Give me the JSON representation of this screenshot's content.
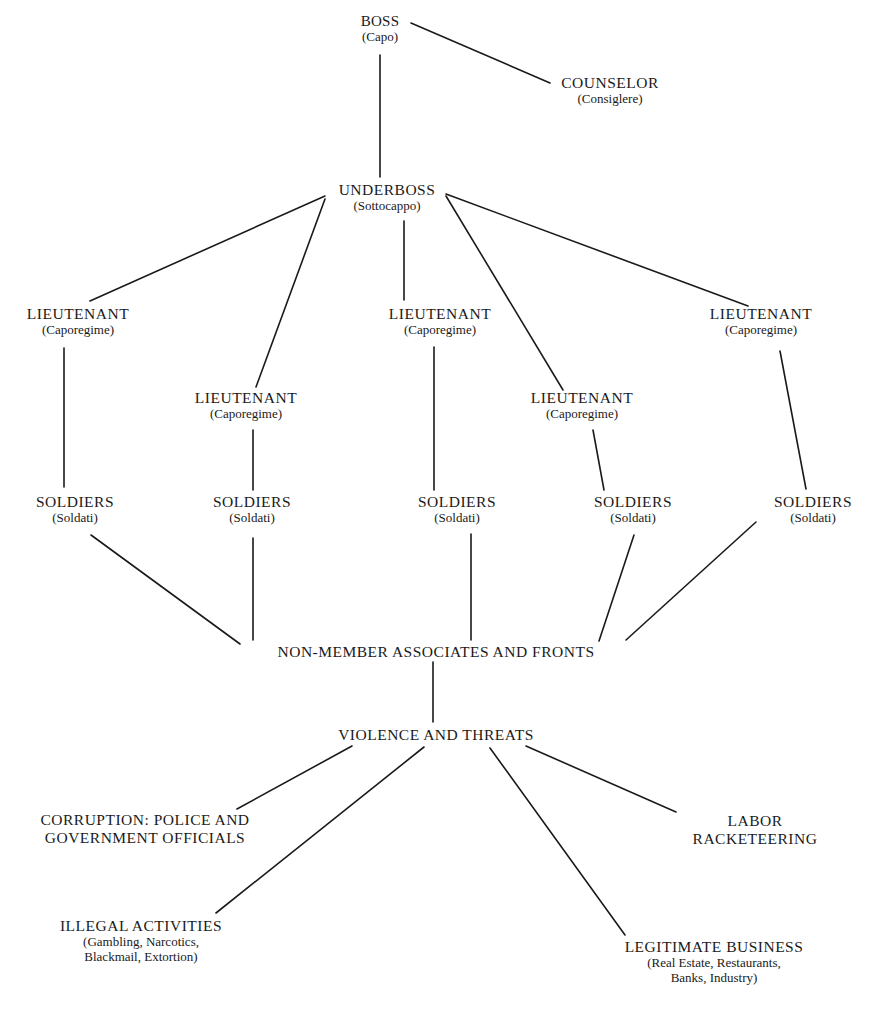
{
  "diagram": {
    "type": "organizational-hierarchy",
    "nodes": {
      "boss": {
        "title": "BOSS",
        "sub": "(Capo)"
      },
      "counselor": {
        "title": "COUNSELOR",
        "sub": "(Consiglere)"
      },
      "underboss": {
        "title": "UNDERBOSS",
        "sub": "(Sottocappo)"
      },
      "lieutenants": [
        {
          "title": "LIEUTENANT",
          "sub": "(Caporegime)"
        },
        {
          "title": "LIEUTENANT",
          "sub": "(Caporegime)"
        },
        {
          "title": "LIEUTENANT",
          "sub": "(Caporegime)"
        },
        {
          "title": "LIEUTENANT",
          "sub": "(Caporegime)"
        },
        {
          "title": "LIEUTENANT",
          "sub": "(Caporegime)"
        }
      ],
      "soldiers": [
        {
          "title": "SOLDIERS",
          "sub": "(Soldati)"
        },
        {
          "title": "SOLDIERS",
          "sub": "(Soldati)"
        },
        {
          "title": "SOLDIERS",
          "sub": "(Soldati)"
        },
        {
          "title": "SOLDIERS",
          "sub": "(Soldati)"
        },
        {
          "title": "SOLDIERS",
          "sub": "(Soldati)"
        }
      ],
      "associates": {
        "title": "NON-MEMBER ASSOCIATES AND FRONTS"
      },
      "violence": {
        "title": "VIOLENCE AND THREATS"
      },
      "corruption": {
        "line1": "CORRUPTION: POLICE AND",
        "line2": "GOVERNMENT OFFICIALS"
      },
      "labor": {
        "line1": "LABOR",
        "line2": "RACKETEERING"
      },
      "illegal": {
        "title": "ILLEGAL ACTIVITIES",
        "line1": "(Gambling, Narcotics,",
        "line2": "Blackmail, Extortion)"
      },
      "legitimate": {
        "title": "LEGITIMATE BUSINESS",
        "line1": "(Real Estate, Restaurants,",
        "line2": "Banks, Industry)"
      }
    },
    "edges": [
      [
        "boss",
        "counselor"
      ],
      [
        "boss",
        "underboss"
      ],
      [
        "underboss",
        "lieutenant-1"
      ],
      [
        "underboss",
        "lieutenant-2"
      ],
      [
        "underboss",
        "lieutenant-3"
      ],
      [
        "underboss",
        "lieutenant-4"
      ],
      [
        "underboss",
        "lieutenant-5"
      ],
      [
        "lieutenant-1",
        "soldiers-1"
      ],
      [
        "lieutenant-2",
        "soldiers-2"
      ],
      [
        "lieutenant-3",
        "soldiers-3"
      ],
      [
        "lieutenant-4",
        "soldiers-4"
      ],
      [
        "lieutenant-5",
        "soldiers-5"
      ],
      [
        "soldiers-1",
        "associates"
      ],
      [
        "soldiers-2",
        "associates"
      ],
      [
        "soldiers-3",
        "associates"
      ],
      [
        "soldiers-4",
        "associates"
      ],
      [
        "soldiers-5",
        "associates"
      ],
      [
        "associates",
        "violence"
      ],
      [
        "violence",
        "corruption"
      ],
      [
        "violence",
        "illegal"
      ],
      [
        "violence",
        "legitimate"
      ],
      [
        "violence",
        "labor"
      ]
    ]
  }
}
